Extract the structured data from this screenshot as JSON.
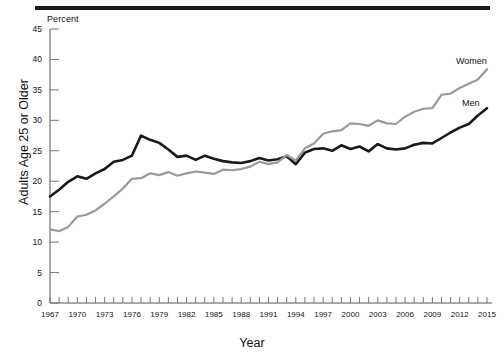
{
  "chart_data": {
    "type": "line",
    "title": "",
    "subtitle": "",
    "unit_label": "Percent",
    "xlabel": "Year",
    "ylabel": "Adults Age 25 or Older",
    "ylim": [
      0,
      45
    ],
    "ytick_step": 5,
    "yticks": [
      0,
      5,
      10,
      15,
      20,
      25,
      30,
      35,
      40,
      45
    ],
    "xlim": [
      1967,
      2015
    ],
    "xticks_labeled": [
      1967,
      1970,
      1973,
      1976,
      1979,
      1982,
      1985,
      1988,
      1991,
      1994,
      1997,
      2000,
      2003,
      2006,
      2009,
      2012,
      2015
    ],
    "grid": false,
    "legend_position": "inline-right",
    "x": [
      1967,
      1968,
      1969,
      1970,
      1971,
      1972,
      1973,
      1974,
      1975,
      1976,
      1977,
      1978,
      1979,
      1980,
      1981,
      1982,
      1983,
      1984,
      1985,
      1986,
      1987,
      1988,
      1989,
      1990,
      1991,
      1992,
      1993,
      1994,
      1995,
      1996,
      1997,
      1998,
      1999,
      2000,
      2001,
      2002,
      2003,
      2004,
      2005,
      2006,
      2007,
      2008,
      2009,
      2010,
      2011,
      2012,
      2013,
      2014,
      2015
    ],
    "series": [
      {
        "name": "Men",
        "color": "#1a1a1a",
        "label": "Men",
        "values": [
          17.5,
          18.6,
          19.9,
          20.8,
          20.4,
          21.3,
          22.0,
          23.2,
          23.5,
          24.2,
          27.5,
          26.8,
          26.3,
          25.2,
          24.0,
          24.2,
          23.5,
          24.2,
          23.7,
          23.3,
          23.1,
          23.0,
          23.3,
          23.8,
          23.4,
          23.6,
          24.1,
          22.8,
          24.7,
          25.3,
          25.4,
          25.0,
          25.9,
          25.3,
          25.7,
          24.9,
          26.1,
          25.4,
          25.2,
          25.4,
          26.0,
          26.3,
          26.2,
          27.1,
          28.0,
          28.8,
          29.4,
          30.8,
          32.0
        ]
      },
      {
        "name": "Women",
        "color": "#9a9a9a",
        "label": "Women",
        "values": [
          12.1,
          11.8,
          12.5,
          14.2,
          14.5,
          15.2,
          16.3,
          17.5,
          18.8,
          20.4,
          20.5,
          21.3,
          21.0,
          21.5,
          20.9,
          21.3,
          21.6,
          21.4,
          21.2,
          21.9,
          21.8,
          22.0,
          22.4,
          23.2,
          22.8,
          23.1,
          24.3,
          23.4,
          25.4,
          26.2,
          27.8,
          28.2,
          28.4,
          29.5,
          29.4,
          29.1,
          30.0,
          29.5,
          29.4,
          30.6,
          31.4,
          31.9,
          32.0,
          34.2,
          34.4,
          35.3,
          36.0,
          36.7,
          38.4
        ]
      }
    ]
  },
  "axes": {
    "percent_caption": "Percent",
    "x_title": "Year",
    "y_title": "Adults Age 25 or Older"
  }
}
